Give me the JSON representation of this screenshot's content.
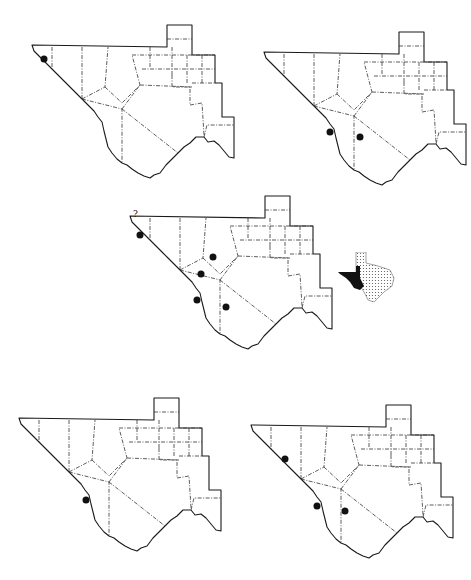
{
  "figure": {
    "type": "distribution-maps",
    "region": "Trans-Pecos Texas",
    "panel_count": 5,
    "inset": {
      "name": "texas-locator-inset",
      "highlight": "trans-pecos",
      "highlight_color": "#111111",
      "rest_pattern": "stippled"
    },
    "colors": {
      "outline": "#1a1a1a",
      "county_boundary": "#333333",
      "record_dot": "#111111",
      "background": "#ffffff"
    },
    "panels": [
      {
        "id": "top-left",
        "records": [
          {
            "area": "far-west-tip",
            "uncertain": false
          }
        ]
      },
      {
        "id": "top-right",
        "records": [
          {
            "area": "presidio-south",
            "uncertain": false
          },
          {
            "area": "brewster",
            "uncertain": false
          }
        ]
      },
      {
        "id": "middle",
        "question_mark": "?",
        "records": [
          {
            "area": "far-west-tip",
            "uncertain": true
          },
          {
            "area": "pecos-north",
            "uncertain": false
          },
          {
            "area": "jeff-davis",
            "uncertain": false
          },
          {
            "area": "presidio",
            "uncertain": false
          },
          {
            "area": "brewster",
            "uncertain": false
          }
        ]
      },
      {
        "id": "bottom-left",
        "records": [
          {
            "area": "presidio",
            "uncertain": false
          }
        ]
      },
      {
        "id": "bottom-right",
        "records": [
          {
            "area": "hudspeth",
            "uncertain": false
          },
          {
            "area": "presidio",
            "uncertain": false
          },
          {
            "area": "brewster",
            "uncertain": false
          }
        ]
      }
    ]
  }
}
